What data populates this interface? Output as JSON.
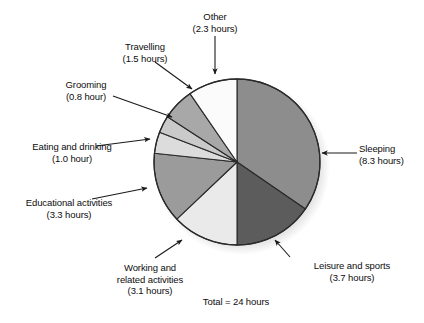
{
  "chart_data": {
    "type": "pie",
    "title": "",
    "subtitle": "",
    "total_label": "Total = 24 hours",
    "total_hours": 24,
    "units": "hours",
    "start_angle_deg": 0,
    "direction": "clockwise",
    "legend_position": "callout-labels",
    "grid": false,
    "categories": [
      "Sleeping",
      "Leisure and sports",
      "Working and related activities",
      "Educational activities",
      "Eating and drinking",
      "Grooming",
      "Travelling",
      "Other"
    ],
    "values": [
      8.3,
      3.7,
      3.1,
      3.3,
      1.0,
      0.8,
      1.5,
      2.3
    ],
    "slices": [
      {
        "name": "Sleeping",
        "value": 8.3,
        "value_text": "(8.3 hours)",
        "label": "Sleeping",
        "angle_deg": 124.5,
        "color": "#8d8d8d"
      },
      {
        "name": "Leisure and sports",
        "value": 3.7,
        "value_text": "(3.7 hours)",
        "label": "Leisure and sports",
        "angle_deg": 55.5,
        "color": "#5c5c5c"
      },
      {
        "name": "Working and related activities",
        "value": 3.1,
        "value_text": "(3.1 hours)",
        "label_line1": "Working and",
        "label_line2": "related activities",
        "angle_deg": 46.5,
        "color": "#eaeaea"
      },
      {
        "name": "Educational activities",
        "value": 3.3,
        "value_text": "(3.3 hours)",
        "label": "Educational activities",
        "angle_deg": 49.5,
        "color": "#9b9b9b"
      },
      {
        "name": "Eating and drinking",
        "value": 1.0,
        "value_text": "(1.0 hour)",
        "label": "Eating and drinking",
        "angle_deg": 15.0,
        "color": "#dcdcdc"
      },
      {
        "name": "Grooming",
        "value": 0.8,
        "value_text": "(0.8 hour)",
        "label": "Grooming",
        "angle_deg": 12.0,
        "color": "#cacaca"
      },
      {
        "name": "Travelling",
        "value": 1.5,
        "value_text": "(1.5 hours)",
        "label": "Travelling",
        "angle_deg": 22.5,
        "color": "#a8a8a8"
      },
      {
        "name": "Other",
        "value": 2.3,
        "value_text": "(2.3 hours)",
        "label": "Other",
        "angle_deg": 34.5,
        "color": "#fbfbfb"
      }
    ]
  },
  "labels": {
    "other": {
      "name": "Other",
      "hours": "(2.3 hours)"
    },
    "travelling": {
      "name": "Travelling",
      "hours": "(1.5 hours)"
    },
    "grooming": {
      "name": "Grooming",
      "hours": "(0.8 hour)"
    },
    "eating": {
      "name": "Eating and drinking",
      "hours": "(1.0 hour)"
    },
    "educational": {
      "name": "Educational activities",
      "hours": "(3.3 hours)"
    },
    "working": {
      "name_line1": "Working and",
      "name_line2": "related activities",
      "hours": "(3.1 hours)"
    },
    "leisure": {
      "name": "Leisure and sports",
      "hours": "(3.7 hours)"
    },
    "sleeping": {
      "name": "Sleeping",
      "hours": "(8.3 hours)"
    },
    "total": "Total = 24 hours"
  },
  "style": {
    "background": "#ffffff",
    "text_color": "#0d0d0d",
    "outline_color": "#2a2a2a",
    "arrow_color": "#1a1a1a"
  }
}
